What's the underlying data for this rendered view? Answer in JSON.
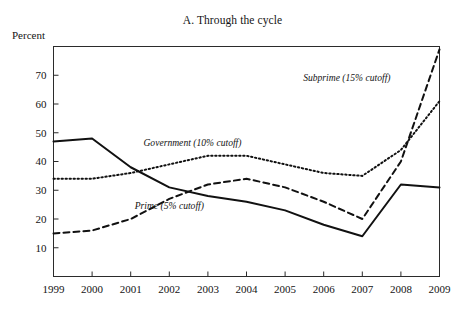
{
  "figure": {
    "title": "A. Through the cycle",
    "y_unit_label": "Percent"
  },
  "chart_data": {
    "type": "line",
    "title": "A. Through the cycle",
    "xlabel": "",
    "ylabel": "Percent",
    "x": [
      1999,
      2000,
      2001,
      2002,
      2003,
      2004,
      2005,
      2006,
      2007,
      2008,
      2009
    ],
    "categories": [
      "1999",
      "2000",
      "2001",
      "2002",
      "2003",
      "2004",
      "2005",
      "2006",
      "2007",
      "2008",
      "2009"
    ],
    "xlim": [
      1999,
      2009
    ],
    "ylim": [
      0,
      80
    ],
    "yticks": [
      10,
      20,
      30,
      40,
      50,
      60,
      70
    ],
    "ytick_labels": [
      "10",
      "20",
      "30",
      "40",
      "50",
      "60",
      "70"
    ],
    "grid": false,
    "legend": "inline-annotations",
    "series": [
      {
        "name": "Prime (5% cutoff)",
        "style": "solid",
        "values": [
          47,
          48,
          38,
          31,
          28,
          26,
          23,
          18,
          14,
          32,
          31
        ]
      },
      {
        "name": "Government (10% cutoff)",
        "style": "dotted",
        "values": [
          34,
          34,
          36,
          39,
          42,
          42,
          39,
          36,
          35,
          44,
          61
        ]
      },
      {
        "name": "Subprime (15% cutoff)",
        "style": "dashed",
        "values": [
          15,
          16,
          20,
          27,
          32,
          34,
          31,
          26,
          20,
          40,
          79
        ]
      }
    ],
    "annotations": [
      {
        "text": "Subprime (15% cutoff)",
        "x": 2006.6,
        "y": 68
      },
      {
        "text": "Government (10% cutoff)",
        "x": 2002.6,
        "y": 45.5
      },
      {
        "text": "Prime (5% cutoff)",
        "x": 2002.0,
        "y": 23.5
      }
    ]
  }
}
